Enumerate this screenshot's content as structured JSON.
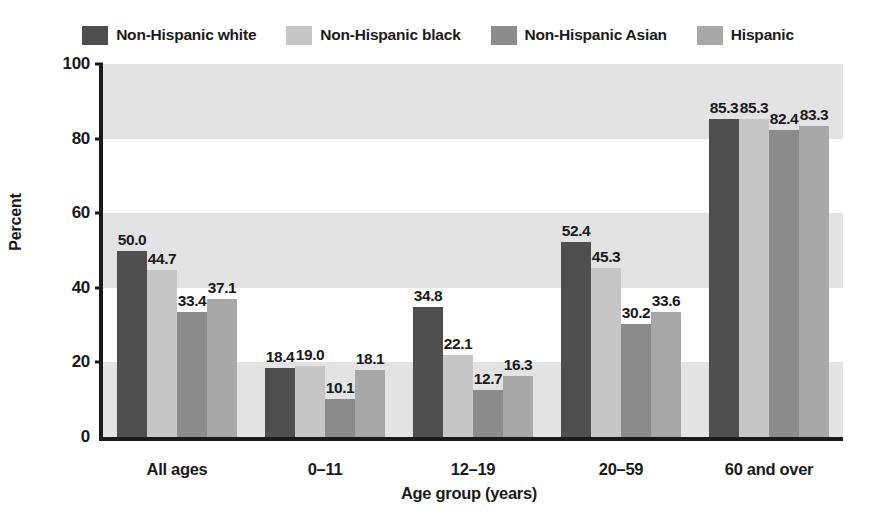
{
  "chart_data": {
    "type": "bar",
    "title": "",
    "subtitle": "",
    "xlabel": "Age group (years)",
    "ylabel": "Percent",
    "categories": [
      "All ages",
      "0–11",
      "12–19",
      "20–59",
      "60 and over"
    ],
    "series": [
      {
        "name": "Non-Hispanic white",
        "color": "#4f4f4f",
        "values": [
          50.0,
          18.4,
          34.8,
          52.4,
          85.3
        ],
        "labels": [
          "50.0",
          "18.4",
          "34.8",
          "52.4",
          "85.3"
        ]
      },
      {
        "name": "Non-Hispanic black",
        "color": "#c6c6c6",
        "values": [
          44.7,
          19.0,
          22.1,
          45.3,
          85.3
        ],
        "labels": [
          "44.7",
          "19.0",
          "22.1",
          "45.3",
          "85.3"
        ]
      },
      {
        "name": "Non-Hispanic Asian",
        "color": "#8b8b8b",
        "values": [
          33.4,
          10.1,
          12.7,
          30.2,
          82.4
        ],
        "labels": [
          "33.4",
          "10.1",
          "12.7",
          "30.2",
          "82.4"
        ]
      },
      {
        "name": "Hispanic",
        "color": "#a8a8a8",
        "values": [
          37.1,
          18.1,
          16.3,
          33.6,
          83.3
        ],
        "labels": [
          "37.1",
          "18.1",
          "16.3",
          "33.6",
          "83.3"
        ]
      }
    ],
    "ylim": [
      0,
      100
    ],
    "yticks": [
      0,
      20,
      40,
      60,
      80,
      100
    ],
    "ytick_labels": [
      "0",
      "20",
      "40",
      "60",
      "80",
      "100"
    ],
    "grid": false,
    "banded_background": true,
    "band_color": "#e3e3e3",
    "bands": [
      [
        80,
        100
      ],
      [
        40,
        60
      ],
      [
        0,
        20
      ]
    ],
    "legend_position": "top-center",
    "value_labels_shown": true
  },
  "legend": {
    "entries": [
      {
        "label": "Non-Hispanic white",
        "color": "#4f4f4f"
      },
      {
        "label": "Non-Hispanic black",
        "color": "#c6c6c6"
      },
      {
        "label": "Non-Hispanic Asian",
        "color": "#8b8b8b"
      },
      {
        "label": "Hispanic",
        "color": "#a8a8a8"
      }
    ]
  },
  "axes": {
    "y_title": "Percent",
    "x_title": "Age group (years)"
  }
}
